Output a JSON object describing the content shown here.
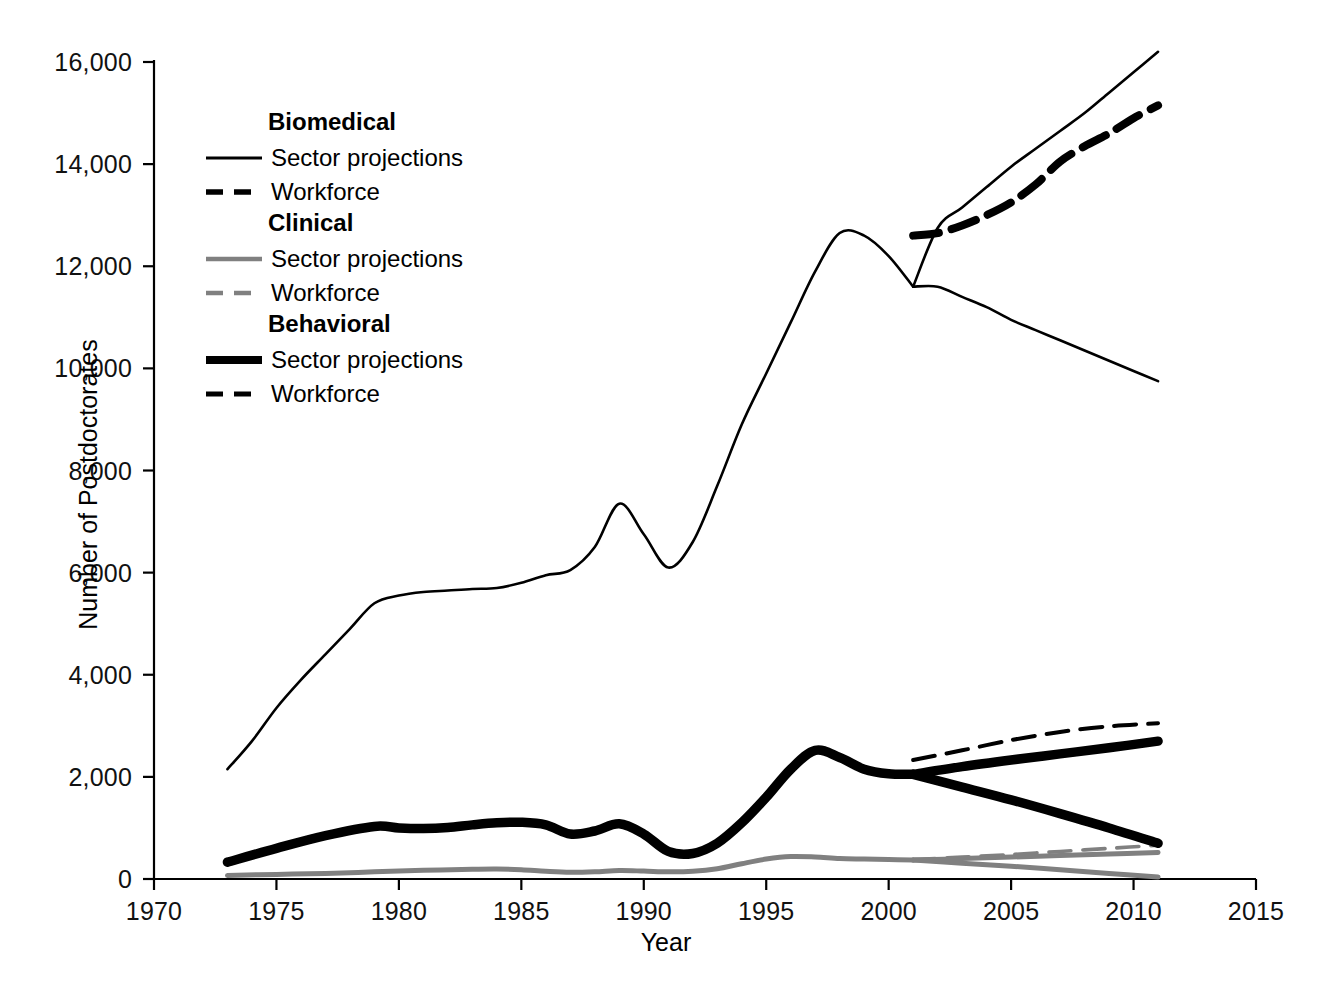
{
  "chart_data": {
    "type": "line",
    "title": "",
    "xlabel": "Year",
    "ylabel": "Number of Postdoctorates",
    "xlim": [
      1970,
      2015
    ],
    "ylim": [
      0,
      16000
    ],
    "xticks": [
      "1970",
      "1975",
      "1980",
      "1985",
      "1990",
      "1995",
      "2000",
      "2005",
      "2010",
      "2015"
    ],
    "xtick_values": [
      1970,
      1975,
      1980,
      1985,
      1990,
      1995,
      2000,
      2005,
      2010,
      2015
    ],
    "yticks": [
      "0",
      "2,000",
      "4,000",
      "6,000",
      "8,000",
      "10,000",
      "12,000",
      "14,000",
      "16,000"
    ],
    "ytick_values": [
      0,
      2000,
      4000,
      6000,
      8000,
      10000,
      12000,
      14000,
      16000
    ],
    "grid": false,
    "legend_position": "upper-left-inside",
    "series": [
      {
        "name": "Biomedical historical",
        "group": "Biomedical",
        "style": "solid-thin",
        "color": "#000000",
        "x": [
          1973,
          1974,
          1975,
          1976,
          1977,
          1978,
          1979,
          1980,
          1981,
          1982,
          1983,
          1984,
          1985,
          1986,
          1987,
          1988,
          1989,
          1990,
          1991,
          1992,
          1993,
          1994,
          1995,
          1996,
          1997,
          1998,
          1999,
          2000,
          2001
        ],
        "values": [
          2150,
          2700,
          3350,
          3900,
          4400,
          4900,
          5400,
          5550,
          5620,
          5650,
          5680,
          5700,
          5800,
          5950,
          6050,
          6500,
          7350,
          6750,
          6100,
          6600,
          7700,
          8900,
          9900,
          10900,
          11900,
          12650,
          12600,
          12200,
          11600
        ]
      },
      {
        "name": "Biomedical sector projections (upper)",
        "group": "Biomedical",
        "style": "solid-thin",
        "color": "#000000",
        "x": [
          2001,
          2002,
          2003,
          2004,
          2005,
          2006,
          2007,
          2008,
          2009,
          2010,
          2011
        ],
        "values": [
          11600,
          12750,
          13150,
          13550,
          13950,
          14300,
          14650,
          15000,
          15400,
          15800,
          16200
        ]
      },
      {
        "name": "Biomedical sector projections (lower)",
        "group": "Biomedical",
        "style": "solid-thin",
        "color": "#000000",
        "x": [
          2001,
          2002,
          2003,
          2004,
          2005,
          2006,
          2007,
          2008,
          2009,
          2010,
          2011
        ],
        "values": [
          11600,
          11600,
          11400,
          11200,
          10950,
          10750,
          10550,
          10350,
          10150,
          9950,
          9750
        ]
      },
      {
        "name": "Biomedical workforce",
        "group": "Biomedical",
        "style": "dashed-thick",
        "color": "#000000",
        "x": [
          2001,
          2002,
          2003,
          2004,
          2005,
          2006,
          2007,
          2008,
          2009,
          2010,
          2011
        ],
        "values": [
          12600,
          12650,
          12800,
          13000,
          13250,
          13600,
          14050,
          14350,
          14600,
          14900,
          15150
        ]
      },
      {
        "name": "Clinical historical",
        "group": "Clinical",
        "style": "solid-gray",
        "color": "#808080",
        "x": [
          1973,
          1975,
          1977,
          1979,
          1981,
          1983,
          1984,
          1985,
          1986,
          1987,
          1988,
          1989,
          1990,
          1991,
          1992,
          1993,
          1994,
          1995,
          1996,
          1997,
          1998,
          1999,
          2000,
          2001
        ],
        "values": [
          70,
          90,
          110,
          140,
          170,
          190,
          195,
          180,
          150,
          130,
          140,
          165,
          155,
          140,
          150,
          200,
          300,
          390,
          440,
          430,
          400,
          390,
          380,
          370
        ]
      },
      {
        "name": "Clinical sector projections (upper)",
        "group": "Clinical",
        "style": "solid-gray",
        "color": "#808080",
        "x": [
          2001,
          2003,
          2005,
          2007,
          2009,
          2011
        ],
        "values": [
          370,
          400,
          430,
          460,
          490,
          520
        ]
      },
      {
        "name": "Clinical sector projections (lower)",
        "group": "Clinical",
        "style": "solid-gray",
        "color": "#808080",
        "x": [
          2001,
          2003,
          2005,
          2007,
          2009,
          2011
        ],
        "values": [
          370,
          310,
          250,
          180,
          110,
          40
        ]
      },
      {
        "name": "Clinical workforce",
        "group": "Clinical",
        "style": "dashed-gray",
        "color": "#808080",
        "x": [
          2001,
          2003,
          2005,
          2007,
          2009,
          2011
        ],
        "values": [
          380,
          430,
          480,
          540,
          600,
          660
        ]
      },
      {
        "name": "Behavioral historical",
        "group": "Behavioral",
        "style": "solid-heavy",
        "color": "#000000",
        "x": [
          1973,
          1975,
          1977,
          1979,
          1980,
          1981,
          1982,
          1983,
          1984,
          1985,
          1986,
          1987,
          1988,
          1989,
          1990,
          1991,
          1992,
          1993,
          1994,
          1995,
          1996,
          1997,
          1998,
          1999,
          2000,
          2001
        ],
        "values": [
          330,
          600,
          850,
          1030,
          1000,
          990,
          1010,
          1060,
          1100,
          1110,
          1060,
          880,
          940,
          1080,
          880,
          540,
          500,
          700,
          1100,
          1600,
          2150,
          2520,
          2380,
          2150,
          2060,
          2050
        ]
      },
      {
        "name": "Behavioral sector projections (upper)",
        "group": "Behavioral",
        "style": "solid-heavy",
        "color": "#000000",
        "x": [
          2001,
          2003,
          2005,
          2007,
          2009,
          2011
        ],
        "values": [
          2050,
          2200,
          2330,
          2450,
          2570,
          2700
        ]
      },
      {
        "name": "Behavioral sector projections (lower)",
        "group": "Behavioral",
        "style": "solid-heavy",
        "color": "#000000",
        "x": [
          2001,
          2003,
          2005,
          2007,
          2009,
          2011
        ],
        "values": [
          2050,
          1800,
          1550,
          1280,
          1000,
          700
        ]
      },
      {
        "name": "Behavioral workforce",
        "group": "Behavioral",
        "style": "dashed-medium",
        "color": "#000000",
        "x": [
          2001,
          2003,
          2005,
          2007,
          2009,
          2011
        ],
        "values": [
          2330,
          2520,
          2720,
          2880,
          2990,
          3050
        ]
      }
    ]
  },
  "axes": {
    "ylabel": "Number of Postdoctorates",
    "xlabel": "Year",
    "yticks": [
      "0",
      "2,000",
      "4,000",
      "6,000",
      "8,000",
      "10,000",
      "12,000",
      "14,000",
      "16,000"
    ],
    "xticks": [
      "1970",
      "1975",
      "1980",
      "1985",
      "1990",
      "1995",
      "2000",
      "2005",
      "2010",
      "2015"
    ]
  },
  "legend": {
    "groups": [
      {
        "title": "Biomedical",
        "entries": [
          {
            "label": "Sector projections",
            "swatch": "solid-thin-black"
          },
          {
            "label": "Workforce",
            "swatch": "dashed-thick-black"
          }
        ]
      },
      {
        "title": "Clinical",
        "entries": [
          {
            "label": "Sector projections",
            "swatch": "solid-gray"
          },
          {
            "label": "Workforce",
            "swatch": "dashed-gray"
          }
        ]
      },
      {
        "title": "Behavioral",
        "entries": [
          {
            "label": "Sector projections",
            "swatch": "solid-heavy-black"
          },
          {
            "label": "Workforce",
            "swatch": "dashed-medium-black"
          }
        ]
      }
    ]
  },
  "colors": {
    "biomedical": "#000000",
    "clinical": "#808080",
    "behavioral": "#000000",
    "axis": "#000000",
    "background": "#ffffff"
  }
}
